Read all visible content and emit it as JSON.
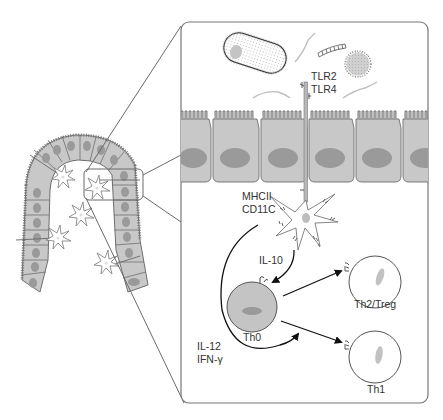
{
  "diagram": {
    "colors": {
      "cell_fill": "#c8c8c8",
      "cell_stroke": "#6e6e6e",
      "nucleus": "#9a9a9a",
      "dc_nucleus": "#bdbdbd",
      "line": "#555555",
      "arrow": "#111111",
      "th0_fill": "#c4c4c4",
      "tcell_nucleus": "#c2c2c2",
      "box_stroke": "#777777"
    },
    "labels": {
      "receptors_line1": "TLR2",
      "receptors_line2": "TLR4",
      "dc_markers_line1": "MHCII",
      "dc_markers_line2": "CD11C",
      "cytokine_il10": "IL-10",
      "cytokine_il12": "IL-12",
      "cytokine_ifn": "IFN-γ",
      "naive_t_cell": "Th0",
      "th2_treg": "Th2/Treg",
      "th1": "Th1"
    },
    "elements": {
      "villus": "Intestinal villus with epithelial cells and dendritic cells",
      "zoom_box": "Magnified epithelium region",
      "bacteria": [
        "rod-shaped bacterium",
        "chain bacterium",
        "coccus",
        "flagella fragments"
      ],
      "dendritic_cell": "Dendritic cell extending dendrite through epithelium",
      "arrows": [
        "IL-10 to Th0",
        "IL-12/IFN-γ loop to Th0",
        "Th0 to Th2/Treg",
        "Th0 to Th1"
      ]
    }
  }
}
